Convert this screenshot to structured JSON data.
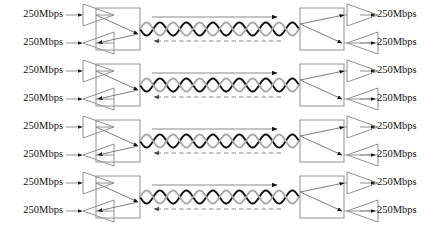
{
  "diagram": {
    "rate_label": "250Mbps",
    "lane_count": 4,
    "colors": {
      "wire_dark": "#111111",
      "wire_light": "#a8a8a8",
      "outline": "#8f8f8f",
      "text": "#101010",
      "background": "#ffffff"
    },
    "cable": {
      "twist_periods": 6,
      "uplink_direction": "right",
      "uplink_style": "solid",
      "downlink_direction": "left",
      "downlink_style": "dashed"
    },
    "lanes": [
      {
        "id": "lane-1",
        "left_tx_label": "250Mbps",
        "left_rx_label": "250Mbps",
        "right_tx_label": "250Mbps",
        "right_rx_label": "250Mbps"
      },
      {
        "id": "lane-2",
        "left_tx_label": "250Mbps",
        "left_rx_label": "250Mbps",
        "right_tx_label": "250Mbps",
        "right_rx_label": "250Mbps"
      },
      {
        "id": "lane-3",
        "left_tx_label": "250Mbps",
        "left_rx_label": "250Mbps",
        "right_tx_label": "250Mbps",
        "right_rx_label": "250Mbps"
      },
      {
        "id": "lane-4",
        "left_tx_label": "250Mbps",
        "left_rx_label": "250Mbps",
        "right_tx_label": "250Mbps",
        "right_rx_label": "250Mbps"
      }
    ]
  }
}
